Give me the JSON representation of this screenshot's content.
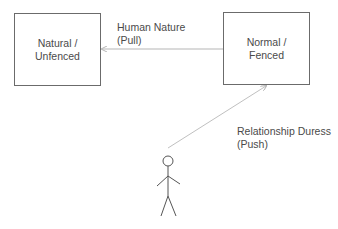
{
  "diagram": {
    "nodes": [
      {
        "id": "natural",
        "label": "Natural /\nUnfenced"
      },
      {
        "id": "normal",
        "label": "Normal /\nFenced"
      }
    ],
    "edges": [
      {
        "from": "normal",
        "to": "natural",
        "label": "Human Nature\n(Pull)"
      },
      {
        "from": "person",
        "to": "normal",
        "label": "Relationship Duress\n(Push)"
      }
    ],
    "actor": {
      "id": "person",
      "icon": "stick-figure-icon"
    },
    "colors": {
      "box_border": "#6b6b6b",
      "arrow": "#b5b5b5",
      "text": "#4a4a4a",
      "figure": "#555555"
    }
  }
}
